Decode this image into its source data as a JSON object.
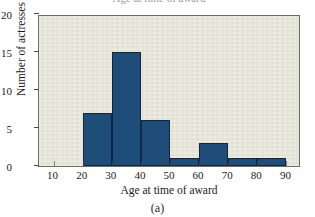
{
  "figure": {
    "caption": "(a)",
    "cropped_title": "Age at time of award"
  },
  "chart_data": {
    "type": "bar",
    "title": "",
    "xlabel": "Age at time of award",
    "ylabel": "Number of actresses",
    "xlim": [
      5,
      95
    ],
    "ylim": [
      0,
      20
    ],
    "grid": false,
    "legend": null,
    "bin_width": 10,
    "categories": [
      "20-30",
      "30-40",
      "40-50",
      "50-60",
      "60-70",
      "70-80",
      "80-90"
    ],
    "bin_edges": [
      20,
      30,
      40,
      50,
      60,
      70,
      80,
      90
    ],
    "values": [
      7,
      15,
      6,
      1,
      3,
      1,
      1
    ],
    "xticks": [
      10,
      20,
      30,
      40,
      50,
      60,
      70,
      80,
      90
    ],
    "xtick_labels": [
      "10",
      "20",
      "30",
      "40",
      "50",
      "60",
      "70",
      "80",
      "90"
    ],
    "yticks": [
      0,
      5,
      10,
      15,
      20
    ],
    "ytick_labels": [
      "0",
      "5",
      "10",
      "15",
      "20"
    ],
    "colors": {
      "bar_fill": "#1d4d78",
      "bar_edge": "#12263f",
      "plot_background": "#e4e3d5",
      "axis": "#6d6d62",
      "page_background": "#ffffff",
      "text": "#1a1a1a"
    }
  }
}
